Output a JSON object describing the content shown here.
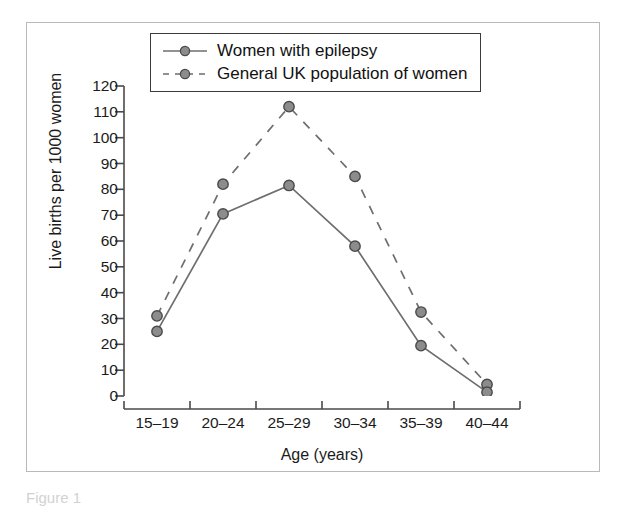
{
  "chart_data": {
    "type": "line",
    "title": "",
    "xlabel": "Age (years)",
    "ylabel": "Live births per 1000 women",
    "categories": [
      "15–19",
      "20–24",
      "25–29",
      "30–34",
      "35–39",
      "40–44"
    ],
    "ylim": [
      0,
      120
    ],
    "yticks": [
      120,
      110,
      100,
      90,
      80,
      70,
      60,
      50,
      40,
      30,
      20,
      10,
      0
    ],
    "grid": false,
    "legend_position": "top-center",
    "series": [
      {
        "name": "Women with epilepsy",
        "style": "solid",
        "marker": "circle",
        "color": "#6e6e6e",
        "values": [
          25,
          70.5,
          81.5,
          58,
          19.5,
          1.5
        ]
      },
      {
        "name": "General UK population of women",
        "style": "dashed",
        "marker": "circle",
        "color": "#6e6e6e",
        "values": [
          31,
          82,
          112,
          85,
          32.5,
          4.5
        ]
      }
    ]
  },
  "legend": {
    "entries": [
      {
        "label": "Women with epilepsy"
      },
      {
        "label": "General UK population of women"
      }
    ]
  },
  "axis": {
    "y_title": "Live births per 1000 women",
    "x_title": "Age (years)"
  },
  "caption": {
    "text": "Figure 1"
  },
  "colors": {
    "line": "#6e6e6e",
    "marker_fill": "#8c8c8c",
    "marker_stroke": "#4a4a4a",
    "axis": "#4a4a4a",
    "frame": "#b9b9b9",
    "text": "#1b1b1b"
  }
}
